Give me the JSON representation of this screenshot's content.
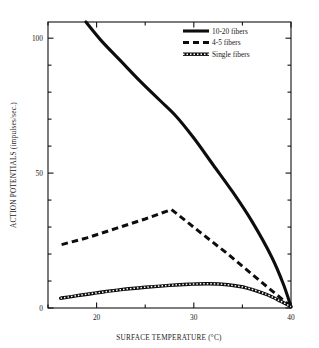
{
  "chart_data": {
    "type": "line",
    "title": "",
    "xlabel": "SURFACE TEMPERATURE (°C)",
    "ylabel": "ACTION POTENTIALS (impulses/sec.)",
    "xlim": [
      15,
      40
    ],
    "ylim": [
      0,
      106
    ],
    "xticks_major": [
      20,
      30,
      40
    ],
    "xticks_major_labels": [
      "20",
      "30",
      "40"
    ],
    "xticks_minor": [
      15,
      25,
      35
    ],
    "yticks_major": [
      0,
      50,
      100
    ],
    "yticks_major_labels": [
      "0",
      "50",
      "100"
    ],
    "yticks_minor": [
      10,
      20,
      30,
      40,
      60,
      70,
      80,
      90
    ],
    "grid": false,
    "legend_position": "top-right",
    "series": [
      {
        "name": "10-20 fibers",
        "style": "solid",
        "x": [
          18.9,
          20.5,
          22.5,
          24.5,
          26.5,
          28.2,
          30.0,
          32.0,
          34.0,
          36.0,
          38.0,
          39.2,
          40.0
        ],
        "values": [
          106.0,
          99.0,
          91.5,
          84.0,
          77.0,
          71.0,
          63.0,
          53.0,
          43.0,
          32.0,
          19.0,
          9.0,
          0.5
        ]
      },
      {
        "name": "4-5 fibers",
        "style": "dashed",
        "x": [
          16.4,
          19.0,
          22.0,
          25.0,
          27.7,
          30.5,
          33.5,
          36.5,
          38.5,
          40.0
        ],
        "values": [
          23.5,
          26.0,
          29.5,
          33.0,
          36.5,
          28.5,
          20.0,
          11.0,
          5.0,
          0.5
        ]
      },
      {
        "name": "Single fibers",
        "style": "hatched",
        "x": [
          16.3,
          18.0,
          20.0,
          22.5,
          25.0,
          27.5,
          29.5,
          31.5,
          33.5,
          35.5,
          37.5,
          39.0,
          40.0
        ],
        "values": [
          3.6,
          4.6,
          5.6,
          6.8,
          7.7,
          8.4,
          8.8,
          9.0,
          8.6,
          7.4,
          5.0,
          2.4,
          0.5
        ]
      }
    ]
  },
  "legend": {
    "items": [
      {
        "label": "10-20 fibers"
      },
      {
        "label": "4-5 fibers"
      },
      {
        "label": "Single fibers"
      }
    ]
  }
}
